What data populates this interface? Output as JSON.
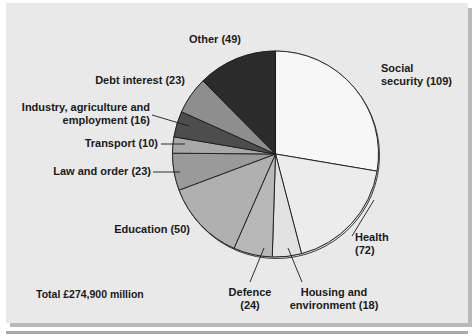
{
  "figure": {
    "total_label": "Total £274,900 million",
    "background_color": "#e9e9e9",
    "outline_color": "#1a1a1a"
  },
  "chart_data": {
    "type": "pie",
    "title": "",
    "units": "£ million (hundreds)",
    "total": 394,
    "total_text": "Total £274,900 million",
    "start_angle_deg": 0,
    "direction": "clockwise",
    "legend": "labels-outside-with-leader-lines",
    "categories": [
      "Social security",
      "Health",
      "Housing and environment",
      "Defence",
      "Education",
      "Law and order",
      "Transport",
      "Industry, agriculture and employment",
      "Debt interest",
      "Other"
    ],
    "values": [
      109,
      72,
      18,
      24,
      50,
      23,
      10,
      16,
      23,
      49
    ],
    "slices": [
      {
        "label": "Social security (109)",
        "name": "Social security",
        "value": 109,
        "color": "#f7f7f7"
      },
      {
        "label": "Health (72)",
        "name": "Health",
        "value": 72,
        "color": "#ececec"
      },
      {
        "label": "Housing and environment (18)",
        "name": "Housing and environment",
        "value": 18,
        "color": "#e2e2e2"
      },
      {
        "label": "Defence (24)",
        "name": "Defence",
        "value": 24,
        "color": "#b8b8b8"
      },
      {
        "label": "Education (50)",
        "name": "Education",
        "value": 50,
        "color": "#b0b0b0"
      },
      {
        "label": "Law and order (23)",
        "name": "Law and order",
        "value": 23,
        "color": "#9a9a9a"
      },
      {
        "label": "Transport (10)",
        "name": "Transport",
        "value": 10,
        "color": "#a8a8a8"
      },
      {
        "label": "Industry, agriculture and employment (16)",
        "name": "Industry, agriculture and employment",
        "value": 16,
        "color": "#4d4d4d"
      },
      {
        "label": "Debt interest (23)",
        "name": "Debt interest",
        "value": 23,
        "color": "#8e8e8e"
      },
      {
        "label": "Other (49)",
        "name": "Other",
        "value": 49,
        "color": "#2b2b2b"
      }
    ]
  },
  "labels": {
    "social_security": "Social\nsecurity (109)",
    "health": "Health\n(72)",
    "housing": "Housing and\nenvironment (18)",
    "defence": "Defence\n(24)",
    "education": "Education (50)",
    "law_and_order": "Law and order (23)",
    "transport": "Transport (10)",
    "industry": "Industry, agriculture and\nemployment (16)",
    "debt_interest": "Debt interest (23)",
    "other": "Other (49)"
  }
}
